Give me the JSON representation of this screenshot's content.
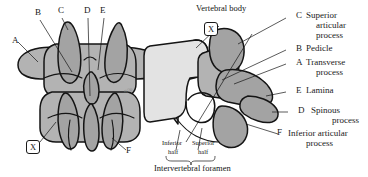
{
  "figure": {
    "title_visible": false,
    "background": "#ffffff",
    "ink": "#141414",
    "fill_light": "#e3e3e3",
    "fill_mid": "#b3b3b3",
    "fill_dark": "#9a9a9a"
  },
  "left_panel": {
    "view": "posterior-view-of-articulated-vertebrae",
    "markers": [
      {
        "id": "A",
        "label": "A"
      },
      {
        "id": "B",
        "label": "B"
      },
      {
        "id": "C",
        "label": "C"
      },
      {
        "id": "D",
        "label": "D"
      },
      {
        "id": "E",
        "label": "E"
      },
      {
        "id": "F",
        "label": "F"
      }
    ],
    "boxed_marker": "X",
    "artifact_text": "scan smudge"
  },
  "right_panel": {
    "view": "lateral-view-of-vertebra",
    "boxed_marker": "X",
    "vertebral_body_label": "Vertebral body",
    "foramen": {
      "inferior_half": "Inferior",
      "inferior_half_2": "half",
      "superior_half": "Superior",
      "superior_half_2": "half",
      "caption": "Intervertebral foramen"
    },
    "markers": [
      {
        "id": "F",
        "label": "F"
      }
    ]
  },
  "legend": {
    "items": [
      {
        "letter": "C",
        "line1": "Superior",
        "line2": "articular",
        "line3": "process"
      },
      {
        "letter": "B",
        "line1": "Pedicle",
        "line2": "",
        "line3": ""
      },
      {
        "letter": "A",
        "line1": "Transverse",
        "line2": "process",
        "line3": ""
      },
      {
        "letter": "E",
        "line1": "Lamina",
        "line2": "",
        "line3": ""
      },
      {
        "letter": "D",
        "line1": "Spinous",
        "line2": "process",
        "line3": ""
      },
      {
        "letter": "F",
        "line1": "Inferior articular",
        "line2": "process",
        "line3": ""
      }
    ]
  }
}
